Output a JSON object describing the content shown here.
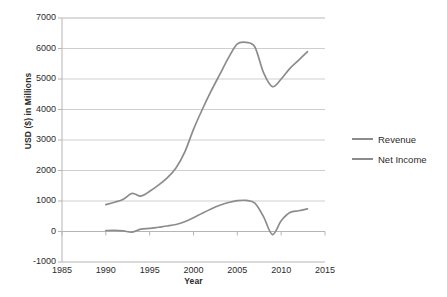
{
  "chart_data": {
    "type": "line",
    "title": "",
    "subtitle": "",
    "xlabel": "Year",
    "ylabel": "USD ($) in Millions",
    "xlim": [
      1985,
      2015
    ],
    "ylim": [
      -1000,
      7000
    ],
    "xticks": [
      1985,
      1990,
      1995,
      2000,
      2005,
      2010,
      2015
    ],
    "yticks": [
      -1000,
      0,
      1000,
      2000,
      3000,
      4000,
      5000,
      6000,
      7000
    ],
    "grid": "horizontal",
    "legend_position": "right-outside",
    "line_color": "#8c8c8c",
    "grid_color": "#cfcfcf",
    "axis_color": "#b5b5b5",
    "x": [
      1990,
      1991,
      1992,
      1993,
      1994,
      1995,
      1996,
      1997,
      1998,
      1999,
      2000,
      2001,
      2002,
      2003,
      2004,
      2005,
      2006,
      2007,
      2008,
      2009,
      2010,
      2011,
      2012,
      2013
    ],
    "series": [
      {
        "name": "Revenue",
        "values": [
          880,
          960,
          1060,
          1250,
          1160,
          1320,
          1520,
          1760,
          2080,
          2600,
          3350,
          4000,
          4600,
          5150,
          5700,
          6150,
          6200,
          6050,
          5200,
          4750,
          5000,
          5350,
          5620,
          5900
        ]
      },
      {
        "name": "Net Income",
        "values": [
          30,
          40,
          20,
          -20,
          80,
          100,
          140,
          180,
          230,
          320,
          450,
          600,
          740,
          860,
          950,
          1010,
          1020,
          930,
          480,
          -100,
          350,
          620,
          680,
          740
        ]
      }
    ],
    "legend": [
      "Revenue",
      "Net Income"
    ]
  },
  "axis": {
    "ylabel_title": "USD ($) in Millions",
    "xlabel_title": "Year",
    "ytick_labels": [
      "7000",
      "6000",
      "5000",
      "4000",
      "3000",
      "2000",
      "1000",
      "0",
      "-1000"
    ],
    "xtick_labels": [
      "1985",
      "1990",
      "1995",
      "2000",
      "2005",
      "2010",
      "2015"
    ]
  },
  "legend": {
    "items": [
      {
        "label": "Revenue"
      },
      {
        "label": "Net Income"
      }
    ]
  }
}
